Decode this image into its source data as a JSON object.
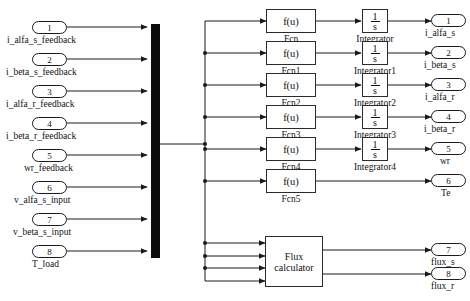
{
  "diagram": {
    "mux": {
      "name": "bus-mux-bar"
    },
    "inputs": [
      {
        "num": "1",
        "label": "i_alfa_s_feedback"
      },
      {
        "num": "2",
        "label": "i_beta_s_feedback"
      },
      {
        "num": "3",
        "label": "i_alfa_r_feedback"
      },
      {
        "num": "4",
        "label": "i_beta_r_feedback"
      },
      {
        "num": "5",
        "label": "wr_feedback"
      },
      {
        "num": "6",
        "label": "v_alfa_s_input"
      },
      {
        "num": "7",
        "label": "v_beta_s_input"
      },
      {
        "num": "8",
        "label": "T_load"
      }
    ],
    "fcn_blocks": [
      {
        "text": "f(u)",
        "label": "Fcn"
      },
      {
        "text": "f(u)",
        "label": "Fcn1"
      },
      {
        "text": "f(u)",
        "label": "Fcn2"
      },
      {
        "text": "f(u)",
        "label": "Fcn3"
      },
      {
        "text": "f(u)",
        "label": "Fcn4"
      },
      {
        "text": "f(u)",
        "label": "Fcn5"
      }
    ],
    "integrator_blocks": [
      {
        "numerator": "1",
        "denominator": "s",
        "label": "Integrator"
      },
      {
        "numerator": "1",
        "denominator": "s",
        "label": "Integrator1"
      },
      {
        "numerator": "1",
        "denominator": "s",
        "label": "Integrator2"
      },
      {
        "numerator": "1",
        "denominator": "s",
        "label": "Integrator3"
      },
      {
        "numerator": "1",
        "denominator": "s",
        "label": "Integrator4"
      }
    ],
    "flux_calculator": {
      "label": "Flux calculator"
    },
    "outputs": [
      {
        "num": "1",
        "label": "i_alfa_s"
      },
      {
        "num": "2",
        "label": "i_beta_s"
      },
      {
        "num": "3",
        "label": "i_alfa_r"
      },
      {
        "num": "4",
        "label": "i_beta_r"
      },
      {
        "num": "5",
        "label": "wr"
      },
      {
        "num": "6",
        "label": "Te"
      },
      {
        "num": "7",
        "label": "flux_s"
      },
      {
        "num": "8",
        "label": "flux_r"
      }
    ],
    "colors": {
      "line": "#1a1a1a",
      "mux_fill": "#0b0b0b",
      "block_border": "#2b2b2b",
      "background": "#ffffff"
    }
  }
}
